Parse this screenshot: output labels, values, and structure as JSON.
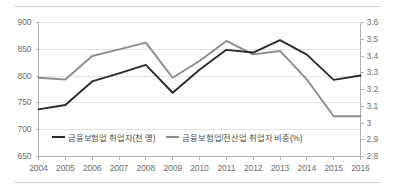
{
  "chart_data": {
    "type": "line",
    "title": "",
    "xlabel": "",
    "ylabel": "",
    "grid": true,
    "legend_position": "bottom-inside",
    "categories": [
      2004,
      2005,
      2006,
      2007,
      2008,
      2009,
      2010,
      2011,
      2012,
      2013,
      2014,
      2015,
      2016
    ],
    "x_tick_labels": [
      "2004",
      "2005",
      "2006",
      "2007",
      "2008",
      "2009",
      "2010",
      "2011",
      "2012",
      "2013",
      "2014",
      "2015",
      "2016"
    ],
    "axes": [
      {
        "id": "left",
        "ylim": [
          650,
          900
        ],
        "ticks": [
          650,
          700,
          750,
          800,
          850,
          900
        ],
        "tick_labels": [
          "650",
          "700",
          "750",
          "800",
          "850",
          "900"
        ]
      },
      {
        "id": "right",
        "ylim": [
          2.8,
          3.6
        ],
        "ticks": [
          2.8,
          2.9,
          3.0,
          3.1,
          3.2,
          3.3,
          3.4,
          3.5,
          3.6
        ],
        "tick_labels": [
          "2.8",
          "2.9",
          "3",
          "3.1",
          "3.2",
          "3.3",
          "3.4",
          "3.5",
          "3.6"
        ]
      }
    ],
    "series": [
      {
        "name": "금융보험업 취업자(천 명)",
        "axis": "left",
        "color": "#2b2b2b",
        "values": [
          738,
          746,
          790,
          805,
          821,
          769,
          812,
          849,
          844,
          867,
          840,
          793,
          801
        ]
      },
      {
        "name": "금융보험업/전산업 취업자 비중(%)",
        "axis": "right",
        "color": "#8c8c8c",
        "values": [
          3.27,
          3.26,
          3.4,
          3.44,
          3.48,
          3.27,
          3.37,
          3.49,
          3.41,
          3.43,
          3.26,
          3.04,
          3.04
        ]
      }
    ]
  },
  "colors": {
    "series_dark": "#2b2b2b",
    "series_gray": "#8c8c8c",
    "grid": "#e2e2e2",
    "axis": "#b0b0b0",
    "tick_text": "#6d6d6d",
    "rule": "#d2d2d2",
    "background": "#ffffff"
  }
}
